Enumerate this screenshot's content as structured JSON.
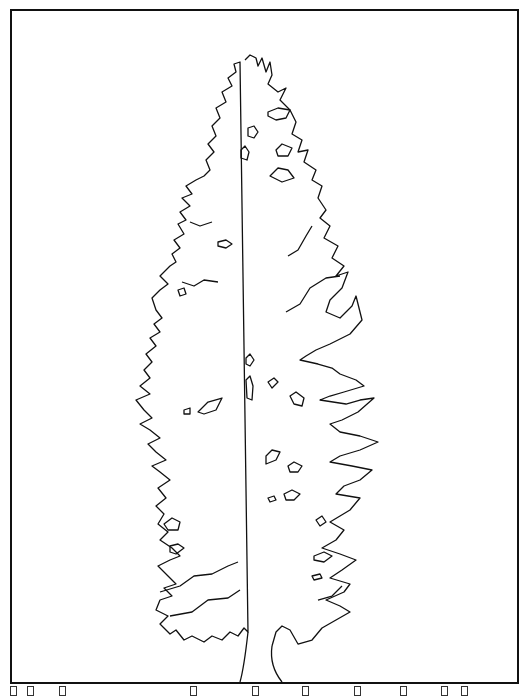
{
  "artwork": {
    "subject": "conifer-tree-line-drawing",
    "stroke_color": "#111111",
    "background_color": "#ffffff"
  },
  "glyph_row": {
    "positions": [
      10,
      27,
      59,
      190,
      252,
      302,
      354,
      400,
      441,
      461
    ]
  }
}
